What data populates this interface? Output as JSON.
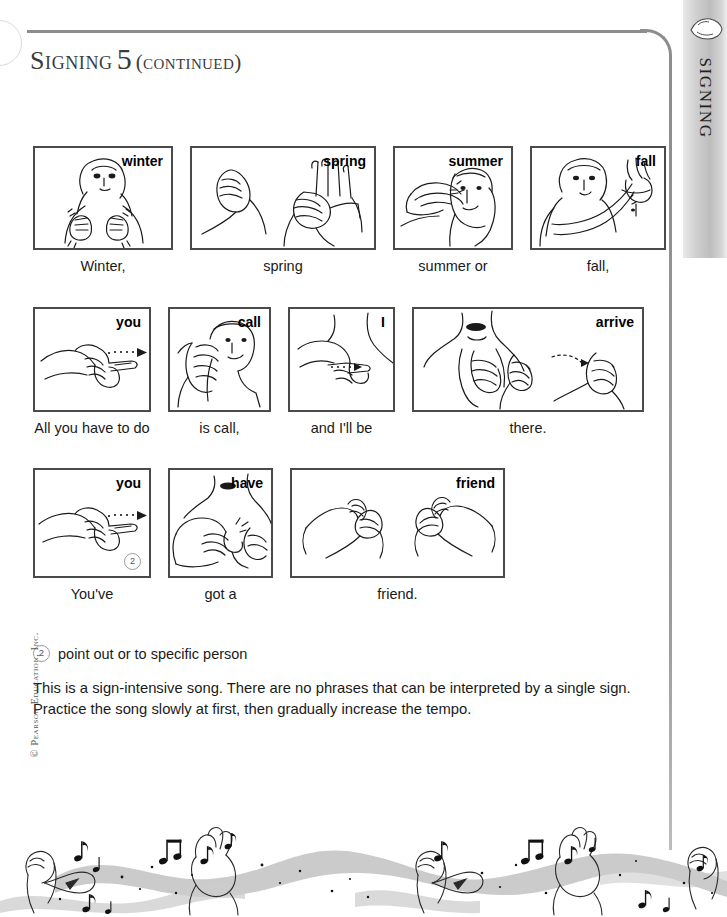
{
  "page": {
    "title_main": "Signing",
    "title_number": "5",
    "title_continued": "(continued)",
    "side_tab_label": "Signing",
    "side_tab_icon": "hand-icon",
    "copyright": "© Pearson Education, Inc.",
    "frame_color": "#8d8d8d",
    "tab_color": "#bdbdbd",
    "panel_border_color": "#4a4a4a",
    "text_color": "#1a1a1a"
  },
  "rows": [
    {
      "row_name": "seasons-row",
      "cells": [
        {
          "word": "winter",
          "caption": "Winter,",
          "art": "sign-winter",
          "width": 140,
          "height": 104,
          "footnote": null
        },
        {
          "word": "spring",
          "caption": "spring",
          "art": "sign-spring",
          "width": 186,
          "height": 104,
          "footnote": null
        },
        {
          "word": "summer",
          "caption": "summer or",
          "art": "sign-summer",
          "width": 120,
          "height": 104,
          "footnote": null
        },
        {
          "word": "fall",
          "caption": "fall,",
          "art": "sign-fall",
          "width": 136,
          "height": 104,
          "footnote": null
        }
      ]
    },
    {
      "row_name": "call-row",
      "cells": [
        {
          "word": "you",
          "caption": "All you have to do",
          "art": "sign-you",
          "width": 118,
          "height": 105,
          "footnote": null
        },
        {
          "word": "call",
          "caption": "is call,",
          "art": "sign-call",
          "width": 103,
          "height": 105,
          "footnote": null
        },
        {
          "word": "I",
          "caption": "and I'll be",
          "art": "sign-i",
          "width": 107,
          "height": 105,
          "footnote": null
        },
        {
          "word": "arrive",
          "caption": "there.",
          "art": "sign-arrive",
          "width": 232,
          "height": 105,
          "footnote": null
        }
      ]
    },
    {
      "row_name": "friend-row",
      "cells": [
        {
          "word": "you",
          "caption": "You've",
          "art": "sign-you-2",
          "width": 118,
          "height": 110,
          "footnote": "2"
        },
        {
          "word": "have",
          "caption": "got a",
          "art": "sign-have",
          "width": 105,
          "height": 110,
          "footnote": null
        },
        {
          "word": "friend",
          "caption": "friend.",
          "art": "sign-friend",
          "width": 215,
          "height": 110,
          "footnote": null
        }
      ]
    }
  ],
  "footnote": {
    "number": "2",
    "text": "point out or to specific person"
  },
  "body": {
    "paragraph": "This is a sign-intensive song. There are no phrases that can be interpreted by a single sign. Practice the song slowly at first, then gradually increase the tempo."
  }
}
